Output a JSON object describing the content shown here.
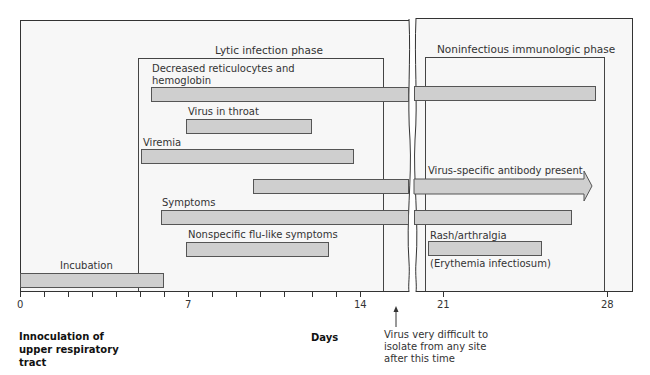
{
  "diagram": {
    "phases": {
      "lytic": "Lytic infection phase",
      "noninfectious": "Noninfectious immunologic phase"
    },
    "bars": [
      {
        "label": "Decreased reticulocytes and hemoglobin",
        "label_line1": "Decreased reticulocytes and",
        "label_line2": "hemoglobin",
        "start_day": 5.5,
        "end_day": 27.5
      },
      {
        "label": "Virus in throat",
        "start_day": 7,
        "end_day": 12
      },
      {
        "label": "Viremia",
        "start_day": 5,
        "end_day": 14
      },
      {
        "label": "Virus-specific antibody present",
        "start_day": 10,
        "end_day": 28,
        "arrow": true
      },
      {
        "label": "Symptoms",
        "start_day": 6,
        "end_day": 26.5
      },
      {
        "label": "Nonspecific flu-like symptoms",
        "start_day": 7,
        "end_day": 13
      },
      {
        "label": "Rash/arthralgia",
        "sublabel": "(Erythemia infectiosum)",
        "start_day": 20,
        "end_day": 25
      },
      {
        "label": "Incubation",
        "start_day": 0,
        "end_day": 6
      }
    ],
    "axis": {
      "label": "Days",
      "ticks": [
        "0",
        "7",
        "14",
        "21",
        "28"
      ],
      "start_note_line1": "Innoculation of",
      "start_note_line2": "upper respiratory",
      "start_note_line3": "tract",
      "marker_note_line1": "Virus very difficult to",
      "marker_note_line2": "isolate from any site",
      "marker_note_line3": "after this time"
    },
    "colors": {
      "bar_fill": "#cfcfcf",
      "panel_bg": "#f7f7f7",
      "line": "#333333"
    }
  }
}
